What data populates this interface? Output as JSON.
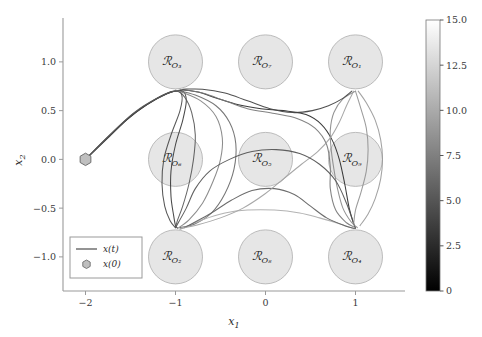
{
  "chart_data": {
    "type": "line",
    "title": "",
    "xlabel": "x_1",
    "ylabel": "x_2",
    "xlim": [
      -2.25,
      1.55
    ],
    "ylim": [
      -1.35,
      1.45
    ],
    "xticks": [
      -2,
      -1,
      0,
      1
    ],
    "xtick_labels": [
      "−2",
      "−1",
      "0",
      "1"
    ],
    "yticks": [
      -1.0,
      -0.5,
      0.0,
      0.5,
      1.0
    ],
    "ytick_labels": [
      "−1.0",
      "−0.5",
      "0.0",
      "0.5",
      "1.0"
    ],
    "grid": false,
    "legend_position": "lower left",
    "legend_entries": [
      {
        "label": "x(t)",
        "marker": "line",
        "color": "#4d4d4d"
      },
      {
        "label": "x(0)",
        "marker": "hexagon",
        "color": "#b0b0b0"
      }
    ],
    "colorbar": {
      "label": "",
      "vmin": 0,
      "vmax": 15.0,
      "ticks": [
        0,
        2.5,
        5.0,
        7.5,
        10.0,
        12.5,
        15.0
      ],
      "tick_labels": [
        "0",
        "2.5",
        "5.0",
        "7.5",
        "10.0",
        "12.5",
        "15.0"
      ],
      "colormap": "gray",
      "orientation": "vertical"
    },
    "start_point": {
      "label": "x(0)",
      "x": -2.0,
      "y": 0.0
    },
    "obstacles": [
      {
        "id": "o3",
        "label": "ℛ",
        "sub": "O₃",
        "cx": -1.0,
        "cy": 1.0,
        "r": 0.3
      },
      {
        "id": "o7",
        "label": "ℛ",
        "sub": "O₇",
        "cx": 0.0,
        "cy": 1.0,
        "r": 0.3
      },
      {
        "id": "o1",
        "label": "ℛ",
        "sub": "O₁",
        "cx": 1.0,
        "cy": 1.0,
        "r": 0.3
      },
      {
        "id": "o6",
        "label": "ℛ",
        "sub": "O₆",
        "cx": -1.0,
        "cy": 0.0,
        "r": 0.3
      },
      {
        "id": "o5",
        "label": "ℛ",
        "sub": "O₅",
        "cx": 0.0,
        "cy": 0.0,
        "r": 0.3
      },
      {
        "id": "o9",
        "label": "ℛ",
        "sub": "O₉",
        "cx": 1.0,
        "cy": 0.0,
        "r": 0.3
      },
      {
        "id": "o2",
        "label": "ℛ",
        "sub": "O₂",
        "cx": -1.0,
        "cy": -1.0,
        "r": 0.3
      },
      {
        "id": "o8",
        "label": "ℛ",
        "sub": "O₈",
        "cx": 0.0,
        "cy": -1.0,
        "r": 0.3
      },
      {
        "id": "o4",
        "label": "ℛ",
        "sub": "O₄",
        "cx": 1.0,
        "cy": -1.0,
        "r": 0.3
      }
    ],
    "series": [
      {
        "name": "traj_1",
        "color_value": 1.5,
        "color": "#2a2a2a",
        "points": [
          [
            -2,
            0
          ],
          [
            -1.78,
            0.2
          ],
          [
            -1.55,
            0.4
          ],
          [
            -1.32,
            0.56
          ],
          [
            -1.1,
            0.67
          ],
          [
            -0.95,
            0.71
          ],
          [
            -0.75,
            0.69
          ],
          [
            -0.55,
            0.63
          ],
          [
            -0.3,
            0.56
          ],
          [
            -0.05,
            0.52
          ],
          [
            0.2,
            0.5
          ],
          [
            0.45,
            0.46
          ],
          [
            0.62,
            0.36
          ],
          [
            0.74,
            0.2
          ],
          [
            0.82,
            0.0
          ],
          [
            0.88,
            -0.25
          ],
          [
            0.93,
            -0.5
          ],
          [
            0.98,
            -0.66
          ],
          [
            1.0,
            -0.7
          ]
        ]
      },
      {
        "name": "traj_2",
        "color_value": 2.5,
        "color": "#3a3a3a",
        "points": [
          [
            -2,
            0
          ],
          [
            -1.75,
            0.22
          ],
          [
            -1.5,
            0.44
          ],
          [
            -1.25,
            0.6
          ],
          [
            -1.05,
            0.69
          ],
          [
            -0.92,
            0.7
          ],
          [
            -0.88,
            0.6
          ],
          [
            -0.92,
            0.4
          ],
          [
            -1.0,
            0.15
          ],
          [
            -1.05,
            -0.12
          ],
          [
            -1.05,
            -0.38
          ],
          [
            -1.02,
            -0.58
          ],
          [
            -1.0,
            -0.68
          ],
          [
            -0.98,
            -0.7
          ]
        ]
      },
      {
        "name": "traj_3",
        "color_value": 4.0,
        "color": "#4a4a4a",
        "points": [
          [
            -2,
            0
          ],
          [
            -1.74,
            0.24
          ],
          [
            -1.48,
            0.46
          ],
          [
            -1.22,
            0.62
          ],
          [
            -1.02,
            0.7
          ],
          [
            -0.93,
            0.66
          ],
          [
            -0.95,
            0.5
          ],
          [
            -1.05,
            0.25
          ],
          [
            -1.13,
            0.0
          ],
          [
            -1.15,
            -0.25
          ],
          [
            -1.12,
            -0.48
          ],
          [
            -1.06,
            -0.63
          ],
          [
            -1.0,
            -0.7
          ]
        ]
      },
      {
        "name": "traj_4",
        "color_value": 5.5,
        "color": "#585858",
        "points": [
          [
            -2,
            0
          ],
          [
            -1.73,
            0.25
          ],
          [
            -1.46,
            0.48
          ],
          [
            -1.2,
            0.63
          ],
          [
            -1.0,
            0.7
          ],
          [
            -0.9,
            0.64
          ],
          [
            -0.82,
            0.48
          ],
          [
            -0.78,
            0.25
          ],
          [
            -0.8,
            0.0
          ],
          [
            -0.85,
            -0.25
          ],
          [
            -0.92,
            -0.48
          ],
          [
            -0.98,
            -0.63
          ],
          [
            -1.0,
            -0.7
          ]
        ]
      },
      {
        "name": "traj_5",
        "color_value": 7.0,
        "color": "#6a6a6a",
        "points": [
          [
            -1.0,
            0.71
          ],
          [
            -0.78,
            0.66
          ],
          [
            -0.55,
            0.55
          ],
          [
            -0.4,
            0.38
          ],
          [
            -0.33,
            0.16
          ],
          [
            -0.35,
            -0.1
          ],
          [
            -0.45,
            -0.35
          ],
          [
            -0.6,
            -0.55
          ],
          [
            -0.78,
            -0.66
          ],
          [
            -0.95,
            -0.7
          ]
        ]
      },
      {
        "name": "traj_6",
        "color_value": 8.5,
        "color": "#777777",
        "points": [
          [
            -0.95,
            0.72
          ],
          [
            -0.7,
            0.68
          ],
          [
            -0.45,
            0.6
          ],
          [
            -0.2,
            0.52
          ],
          [
            0.1,
            0.47
          ],
          [
            0.35,
            0.42
          ],
          [
            0.55,
            0.32
          ],
          [
            0.68,
            0.15
          ],
          [
            0.72,
            -0.08
          ],
          [
            0.72,
            -0.3
          ],
          [
            0.78,
            -0.52
          ],
          [
            0.9,
            -0.65
          ],
          [
            1.0,
            -0.7
          ]
        ]
      },
      {
        "name": "traj_7",
        "color_value": 10.0,
        "color": "#8a8a8a",
        "points": [
          [
            1.0,
            0.7
          ],
          [
            0.86,
            0.62
          ],
          [
            0.76,
            0.48
          ],
          [
            0.72,
            0.3
          ],
          [
            0.73,
            0.1
          ],
          [
            0.76,
            -0.1
          ],
          [
            0.8,
            -0.3
          ],
          [
            0.86,
            -0.5
          ],
          [
            0.95,
            -0.64
          ],
          [
            1.02,
            -0.7
          ]
        ]
      },
      {
        "name": "traj_8",
        "color_value": 11.5,
        "color": "#9a9a9a",
        "points": [
          [
            1.03,
            0.7
          ],
          [
            1.12,
            0.58
          ],
          [
            1.22,
            0.4
          ],
          [
            1.28,
            0.2
          ],
          [
            1.3,
            0.0
          ],
          [
            1.28,
            -0.2
          ],
          [
            1.22,
            -0.4
          ],
          [
            1.14,
            -0.56
          ],
          [
            1.05,
            -0.68
          ]
        ]
      },
      {
        "name": "traj_9",
        "color_value": 13.0,
        "color": "#adadad",
        "points": [
          [
            -0.95,
            -0.72
          ],
          [
            -0.7,
            -0.62
          ],
          [
            -0.45,
            -0.55
          ],
          [
            -0.2,
            -0.52
          ],
          [
            0.1,
            -0.52
          ],
          [
            0.38,
            -0.55
          ],
          [
            0.6,
            -0.6
          ],
          [
            0.82,
            -0.66
          ],
          [
            0.98,
            -0.71
          ]
        ]
      },
      {
        "name": "traj_10",
        "color_value": 6.0,
        "color": "#606060",
        "points": [
          [
            -0.9,
            -0.7
          ],
          [
            -0.62,
            -0.56
          ],
          [
            -0.38,
            -0.42
          ],
          [
            -0.15,
            -0.32
          ],
          [
            0.1,
            -0.3
          ],
          [
            0.32,
            -0.36
          ],
          [
            0.5,
            -0.48
          ],
          [
            0.68,
            -0.6
          ],
          [
            0.88,
            -0.68
          ],
          [
            1.0,
            -0.71
          ]
        ]
      },
      {
        "name": "traj_11",
        "color_value": 9.0,
        "color": "#828282",
        "points": [
          [
            -0.96,
            0.7
          ],
          [
            -0.72,
            0.6
          ],
          [
            -0.55,
            0.44
          ],
          [
            -0.48,
            0.22
          ],
          [
            -0.5,
            0.0
          ],
          [
            -0.58,
            -0.22
          ],
          [
            -0.7,
            -0.45
          ],
          [
            -0.85,
            -0.62
          ],
          [
            -0.98,
            -0.71
          ]
        ]
      },
      {
        "name": "traj_12",
        "color_value": 3.5,
        "color": "#424242",
        "points": [
          [
            -0.92,
            0.72
          ],
          [
            -0.7,
            0.72
          ],
          [
            -0.45,
            0.68
          ],
          [
            -0.2,
            0.6
          ],
          [
            0.05,
            0.52
          ],
          [
            0.3,
            0.48
          ],
          [
            0.52,
            0.5
          ],
          [
            0.7,
            0.55
          ],
          [
            0.85,
            0.62
          ],
          [
            0.96,
            0.7
          ]
        ]
      },
      {
        "name": "traj_13",
        "color_value": 12.0,
        "color": "#a0a0a0",
        "points": [
          [
            0.98,
            0.7
          ],
          [
            0.9,
            0.55
          ],
          [
            0.82,
            0.38
          ],
          [
            0.72,
            0.22
          ],
          [
            0.58,
            0.08
          ],
          [
            0.4,
            -0.05
          ],
          [
            0.2,
            -0.2
          ],
          [
            0.0,
            -0.35
          ],
          [
            -0.25,
            -0.5
          ],
          [
            -0.5,
            -0.6
          ],
          [
            -0.75,
            -0.67
          ],
          [
            -0.95,
            -0.71
          ]
        ]
      },
      {
        "name": "traj_14",
        "color_value": 5.0,
        "color": "#525252",
        "points": [
          [
            -1.0,
            -0.7
          ],
          [
            -0.88,
            -0.5
          ],
          [
            -0.78,
            -0.3
          ],
          [
            -0.62,
            -0.12
          ],
          [
            -0.4,
            0.0
          ],
          [
            -0.15,
            0.08
          ],
          [
            0.12,
            0.1
          ],
          [
            0.38,
            0.06
          ],
          [
            0.6,
            -0.05
          ],
          [
            0.78,
            -0.22
          ],
          [
            0.9,
            -0.45
          ],
          [
            0.98,
            -0.66
          ]
        ]
      },
      {
        "name": "traj_15",
        "color_value": 10.8,
        "color": "#939393",
        "points": [
          [
            1.0,
            0.7
          ],
          [
            1.06,
            0.52
          ],
          [
            1.12,
            0.32
          ],
          [
            1.14,
            0.1
          ],
          [
            1.12,
            -0.12
          ],
          [
            1.06,
            -0.34
          ],
          [
            1.0,
            -0.52
          ],
          [
            0.98,
            -0.66
          ]
        ]
      }
    ]
  },
  "axes": {
    "x_axis_name": "x-axis",
    "y_axis_name": "y-axis"
  },
  "legend": {
    "line_label": "x(t)",
    "marker_label": "x(0)"
  },
  "colors": {
    "obstacle_fill": "#e6e6e6",
    "obstacle_edge": "#b4b4b4",
    "start_marker_fill": "#bfbfbf",
    "start_marker_edge": "#6e6e6e",
    "axis": "#9a9a9a",
    "text": "#3a3a3a"
  }
}
